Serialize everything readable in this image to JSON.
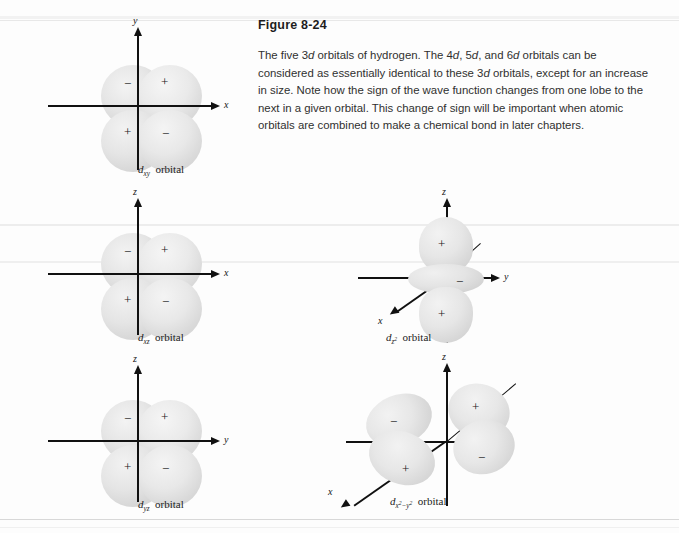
{
  "figure": {
    "title": "Figure 8-24",
    "caption": "The five 3d orbitals of hydrogen. The 4d, 5d, and 6d orbitals can be considered as essentially identical to these 3d orbitals, except for an increase in size. Note how the sign of the wave function changes from one lobe to the next in a given orbital. This change of sign will be important when atomic orbitals are combined to make a chemical bond in later chapters."
  },
  "chart_data": {
    "type": "diagram",
    "title": "Figure 8-24",
    "subtitle": "The five 3d orbitals of hydrogen",
    "grid": false,
    "legend": null,
    "orbitals": [
      {
        "id": "dxy",
        "label_prefix": "d",
        "label_subscript": "xy",
        "label_suffix": "orbital",
        "vertical_axis": "y",
        "horizontal_axis": "x",
        "depth_axis": null,
        "shape": "cloverleaf",
        "lobe_signs": {
          "top_left": "−",
          "top_right": "+",
          "bottom_left": "+",
          "bottom_right": "−"
        }
      },
      {
        "id": "dxz",
        "label_prefix": "d",
        "label_subscript": "xz",
        "label_suffix": "orbital",
        "vertical_axis": "z",
        "horizontal_axis": "x",
        "depth_axis": null,
        "shape": "cloverleaf",
        "lobe_signs": {
          "top_left": "−",
          "top_right": "+",
          "bottom_left": "+",
          "bottom_right": "−"
        }
      },
      {
        "id": "dyz",
        "label_prefix": "d",
        "label_subscript": "yz",
        "label_suffix": "orbital",
        "vertical_axis": "z",
        "horizontal_axis": "y",
        "depth_axis": null,
        "shape": "cloverleaf",
        "lobe_signs": {
          "top_left": "−",
          "top_right": "+",
          "bottom_left": "+",
          "bottom_right": "−"
        }
      },
      {
        "id": "dz2",
        "label_prefix": "d",
        "label_subscript": "z",
        "label_subscript_exp": "2",
        "label_suffix": "orbital",
        "vertical_axis": "z",
        "horizontal_axis": "y",
        "depth_axis": "x",
        "shape": "dumbbell-with-torus",
        "lobe_signs": {
          "top": "+",
          "torus": "−",
          "bottom": "+"
        }
      },
      {
        "id": "dx2-y2",
        "label_prefix": "d",
        "label_subscript": "x",
        "label_subscript_exp": "2",
        "label_subscript_mid": "−y",
        "label_subscript_exp2": "2",
        "label_suffix": "orbital",
        "vertical_axis": "z",
        "horizontal_axis": "y",
        "depth_axis": "x",
        "shape": "cloverleaf-perspective",
        "lobe_signs": {
          "top_left": "−",
          "top_right": "+",
          "bottom_left": "+",
          "bottom_right": "−"
        }
      }
    ],
    "colors": {
      "lobe_fill": "#e5e5e5",
      "axis": "#111111",
      "text": "#222222",
      "background": "#fdfdfd"
    }
  }
}
